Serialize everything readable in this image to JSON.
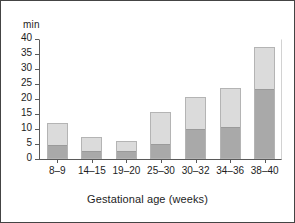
{
  "chart_data": {
    "type": "bar",
    "title": "",
    "subtitle": "",
    "xlabel": "Gestational age (weeks)",
    "ylabel": "min",
    "categories": [
      "8–9",
      "14–15",
      "19–20",
      "25–30",
      "30–32",
      "34–36",
      "38–40"
    ],
    "stacked": true,
    "series": [
      {
        "name": "lower-segment",
        "values": [
          4.5,
          2.5,
          2.3,
          4.8,
          9.8,
          10.2,
          23.0
        ]
      },
      {
        "name": "upper-segment",
        "values": [
          7.5,
          4.7,
          3.8,
          10.8,
          11.0,
          13.4,
          14.5
        ]
      }
    ],
    "totals": [
      12.0,
      7.2,
      6.1,
      15.6,
      20.8,
      23.6,
      37.5
    ],
    "ylim": [
      0,
      40
    ],
    "yticks": [
      0,
      5,
      10,
      15,
      20,
      25,
      30,
      35,
      40
    ],
    "ytick_labels": [
      "0",
      "5",
      "10",
      "15",
      "20",
      "25",
      "30",
      "35",
      "40"
    ],
    "grid": false,
    "legend": "none",
    "colors": {
      "lower_segment": "#a9a9a9",
      "upper_segment": "#dbdbdb",
      "bar_outline": "#b4b4b4",
      "axis": "#5a5a5a",
      "text": "#1d1d1d",
      "frame": "#444444"
    }
  }
}
